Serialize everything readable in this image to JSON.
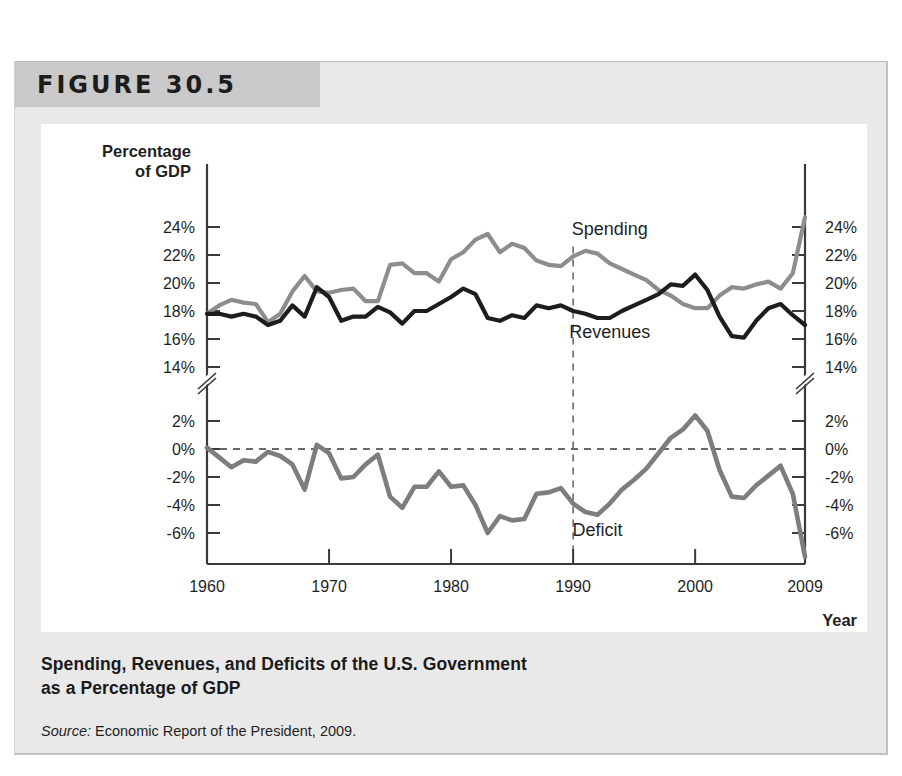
{
  "figure": {
    "banner_label": "FIGURE 30.5",
    "caption_line1": "Spending, Revenues, and Deficits of the U.S. Government",
    "caption_line2": "as a Percentage of GDP",
    "source_label": "Source:",
    "source_text": " Economic Report of the President, 2009."
  },
  "colors": {
    "spending_line": "#8d8d8d",
    "revenues_line": "#1d1d1d",
    "deficit_line": "#7d7d7d",
    "axis": "#3a3a3a",
    "panel_background": "#e9e9e9",
    "banner_background": "#c9c9c9",
    "card_background": "#ffffff"
  },
  "chart_data": {
    "type": "line",
    "title": "Spending, Revenues, and Deficits of the U.S. Government as a Percentage of GDP",
    "xlabel": "Year",
    "ylabel": "Percentage of GDP",
    "grid": false,
    "legend": "inline-labels",
    "axis_break": true,
    "upper_panel": {
      "name": "Spending and Revenues",
      "ylim": [
        13,
        25
      ],
      "yticks": [
        14,
        16,
        18,
        20,
        22,
        24
      ],
      "ytick_labels": [
        "14%",
        "16%",
        "18%",
        "20%",
        "22%",
        "24%"
      ]
    },
    "lower_panel": {
      "name": "Deficit",
      "ylim": [
        -7,
        3
      ],
      "yticks": [
        -6,
        -4,
        -2,
        0,
        2
      ],
      "ytick_labels": [
        "-6%",
        "-4%",
        "-2%",
        "0%",
        "2%"
      ],
      "zero_line": 0
    },
    "xlim": [
      1960,
      2009
    ],
    "xticks": [
      1960,
      1970,
      1980,
      1990,
      2000,
      2009
    ],
    "xtick_labels": [
      "1960",
      "1970",
      "1980",
      "1990",
      "2000",
      "2009"
    ],
    "reference_line_year": 1990,
    "x": [
      1960,
      1961,
      1962,
      1963,
      1964,
      1965,
      1966,
      1967,
      1968,
      1969,
      1970,
      1971,
      1972,
      1973,
      1974,
      1975,
      1976,
      1977,
      1978,
      1979,
      1980,
      1981,
      1982,
      1983,
      1984,
      1985,
      1986,
      1987,
      1988,
      1989,
      1990,
      1991,
      1992,
      1993,
      1994,
      1995,
      1996,
      1997,
      1998,
      1999,
      2000,
      2001,
      2002,
      2003,
      2004,
      2005,
      2006,
      2007,
      2008,
      2009
    ],
    "series": [
      {
        "name": "Spending",
        "label": "Spending",
        "color": "#8d8d8d",
        "panel": "upper",
        "values": [
          17.8,
          18.4,
          18.8,
          18.6,
          18.5,
          17.2,
          17.8,
          19.4,
          20.5,
          19.4,
          19.3,
          19.5,
          19.6,
          18.7,
          18.7,
          21.3,
          21.4,
          20.7,
          20.7,
          20.1,
          21.7,
          22.2,
          23.1,
          23.5,
          22.2,
          22.8,
          22.5,
          21.6,
          21.3,
          21.2,
          21.9,
          22.3,
          22.1,
          21.4,
          21.0,
          20.6,
          20.2,
          19.5,
          19.1,
          18.5,
          18.2,
          18.2,
          19.1,
          19.7,
          19.6,
          19.9,
          20.1,
          19.6,
          20.7,
          24.7
        ]
      },
      {
        "name": "Revenues",
        "label": "Revenues",
        "color": "#1d1d1d",
        "panel": "upper",
        "values": [
          17.8,
          17.8,
          17.6,
          17.8,
          17.6,
          17.0,
          17.3,
          18.4,
          17.6,
          19.7,
          19.0,
          17.3,
          17.6,
          17.6,
          18.3,
          17.9,
          17.1,
          18.0,
          18.0,
          18.5,
          19.0,
          19.6,
          19.2,
          17.5,
          17.3,
          17.7,
          17.5,
          18.4,
          18.2,
          18.4,
          18.0,
          17.8,
          17.5,
          17.5,
          18.0,
          18.4,
          18.8,
          19.2,
          19.9,
          19.8,
          20.6,
          19.5,
          17.6,
          16.2,
          16.1,
          17.3,
          18.2,
          18.5,
          17.7,
          17.0
        ]
      },
      {
        "name": "Deficit",
        "label": "Deficit",
        "color": "#7d7d7d",
        "panel": "lower",
        "values": [
          0.1,
          -0.6,
          -1.3,
          -0.8,
          -0.9,
          -0.2,
          -0.5,
          -1.1,
          -2.9,
          0.3,
          -0.3,
          -2.1,
          -2.0,
          -1.1,
          -0.4,
          -3.4,
          -4.2,
          -2.7,
          -2.7,
          -1.6,
          -2.7,
          -2.6,
          -4.0,
          -6.0,
          -4.8,
          -5.1,
          -5.0,
          -3.2,
          -3.1,
          -2.8,
          -3.9,
          -4.5,
          -4.7,
          -3.9,
          -2.9,
          -2.2,
          -1.4,
          -0.3,
          0.8,
          1.4,
          2.4,
          1.3,
          -1.5,
          -3.4,
          -3.5,
          -2.6,
          -1.9,
          -1.2,
          -3.2,
          -7.7
        ]
      }
    ],
    "annotations": [
      {
        "text": "Spending",
        "year": 1993,
        "value": 23.4,
        "panel": "upper"
      },
      {
        "text": "Revenues",
        "year": 1993,
        "value": 16.1,
        "panel": "upper"
      },
      {
        "text": "Deficit",
        "year": 1992,
        "value": -6.2,
        "panel": "lower"
      }
    ]
  }
}
